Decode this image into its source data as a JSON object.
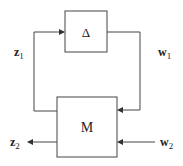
{
  "diagram": {
    "type": "feedback-interconnection",
    "blocks": {
      "delta": {
        "label": "Δ"
      },
      "m": {
        "label": "M"
      }
    },
    "signals": {
      "z1": {
        "base": "z",
        "sub": "1"
      },
      "w1": {
        "base": "w",
        "sub": "1"
      },
      "z2": {
        "base": "z",
        "sub": "2"
      },
      "w2": {
        "base": "w",
        "sub": "2"
      }
    },
    "edges": [
      {
        "from": "M",
        "to": "Δ",
        "signal": "z1"
      },
      {
        "from": "Δ",
        "to": "M",
        "signal": "w1"
      },
      {
        "from": "M",
        "to": "output",
        "signal": "z2"
      },
      {
        "from": "input",
        "to": "M",
        "signal": "w2"
      }
    ],
    "colors": {
      "stroke": "#333333",
      "background": "#ffffff"
    }
  }
}
